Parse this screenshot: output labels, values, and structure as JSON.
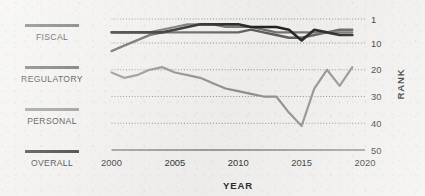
{
  "chart_data": {
    "type": "line",
    "title": "",
    "xlabel": "YEAR",
    "ylabel": "RANK",
    "xlim": [
      2000,
      2020
    ],
    "ylim": [
      1,
      50
    ],
    "y_inverted": true,
    "grid": "horizontal-dotted",
    "legend_position": "left",
    "x_ticks": [
      "2000",
      "2005",
      "2010",
      "2015",
      "2020"
    ],
    "x_tick_values": [
      2000,
      2005,
      2010,
      2015,
      2020
    ],
    "y_ticks": [
      "1",
      "10",
      "20",
      "30",
      "40",
      "50"
    ],
    "y_tick_values": [
      1,
      10,
      20,
      30,
      40,
      50
    ],
    "x": [
      2000,
      2001,
      2002,
      2003,
      2004,
      2005,
      2006,
      2007,
      2008,
      2009,
      2010,
      2011,
      2012,
      2013,
      2014,
      2015,
      2016,
      2017,
      2018,
      2019
    ],
    "series": [
      {
        "name": "FISCAL",
        "color": "#5d5d5d",
        "width": 2.4,
        "values": [
          13,
          11,
          9,
          7,
          6,
          6,
          6,
          6,
          6,
          6,
          6,
          5,
          6,
          7,
          8,
          8,
          7,
          6,
          5,
          5
        ]
      },
      {
        "name": "REGULATORY",
        "color": "#8f8f8f",
        "width": 2.2,
        "values": [
          21,
          23,
          22,
          20,
          19,
          21,
          22,
          23,
          25,
          27,
          28,
          29,
          30,
          30,
          36,
          41,
          27,
          20,
          26,
          19
        ]
      },
      {
        "name": "PERSONAL",
        "color": "#717171",
        "width": 2.2,
        "values": [
          6,
          6,
          6,
          6,
          5,
          4,
          3,
          3,
          3,
          4,
          4,
          4,
          5,
          6,
          6,
          6,
          6,
          6,
          6,
          6
        ]
      },
      {
        "name": "OVERALL",
        "color": "#1f1f1f",
        "width": 2.6,
        "values": [
          6,
          6,
          6,
          6,
          6,
          5,
          4,
          3,
          3,
          3,
          3,
          4,
          4,
          4,
          5,
          9,
          5,
          6,
          7,
          7
        ]
      }
    ]
  },
  "legend": {
    "items": [
      {
        "label": "FISCAL",
        "color": "#5d5d5d"
      },
      {
        "label": "REGULATORY",
        "color": "#5a5a5a"
      },
      {
        "label": "PERSONAL",
        "color": "#8b8b8b"
      },
      {
        "label": "OVERALL",
        "color": "#242424"
      }
    ]
  },
  "axes": {
    "x_title": "YEAR",
    "y_title": "RANK"
  }
}
